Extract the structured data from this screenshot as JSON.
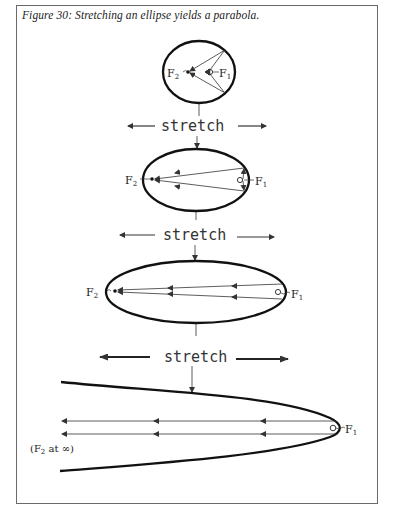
{
  "figure": {
    "caption": "Figure 30: Stretching an ellipse yields a parabola.",
    "stretch_label": "stretch",
    "focus_1": "F",
    "focus_1_sub": "1",
    "focus_2": "F",
    "focus_2_sub": "2",
    "infinity_note_prefix": "(F",
    "infinity_note_sub": "2",
    "infinity_note_suffix": " at ∞)",
    "stages": [
      {
        "name": "circle-like ellipse",
        "shape": "ellipse"
      },
      {
        "name": "moderate ellipse",
        "shape": "ellipse"
      },
      {
        "name": "elongated ellipse",
        "shape": "ellipse"
      },
      {
        "name": "parabola",
        "shape": "parabola"
      }
    ],
    "colors": {
      "ink": "#222222",
      "frame": "#6a6a6a",
      "background": "#ffffff"
    }
  }
}
